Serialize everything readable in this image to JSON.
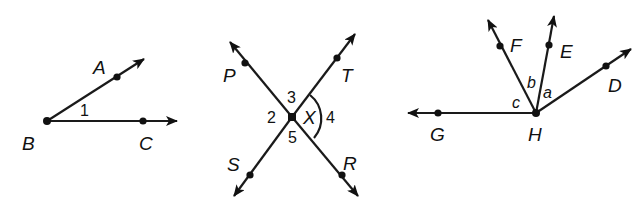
{
  "figures": [
    {
      "id": "angle-abc",
      "vertex": "B",
      "points": {
        "A": "A",
        "B": "B",
        "C": "C"
      },
      "angle_labels": {
        "one": "1"
      }
    },
    {
      "id": "intersecting-lines",
      "vertex": "X",
      "points": {
        "P": "P",
        "T": "T",
        "S": "S",
        "R": "R",
        "X": "X"
      },
      "angle_labels": {
        "two": "2",
        "three": "3",
        "four": "4",
        "five": "5"
      }
    },
    {
      "id": "rays-from-h",
      "vertex": "H",
      "points": {
        "F": "F",
        "E": "E",
        "D": "D",
        "G": "G",
        "H": "H"
      },
      "angle_labels": {
        "a": "a",
        "b": "b",
        "c": "c"
      }
    }
  ],
  "colors": {
    "ink": "#111111",
    "background": "#ffffff"
  }
}
